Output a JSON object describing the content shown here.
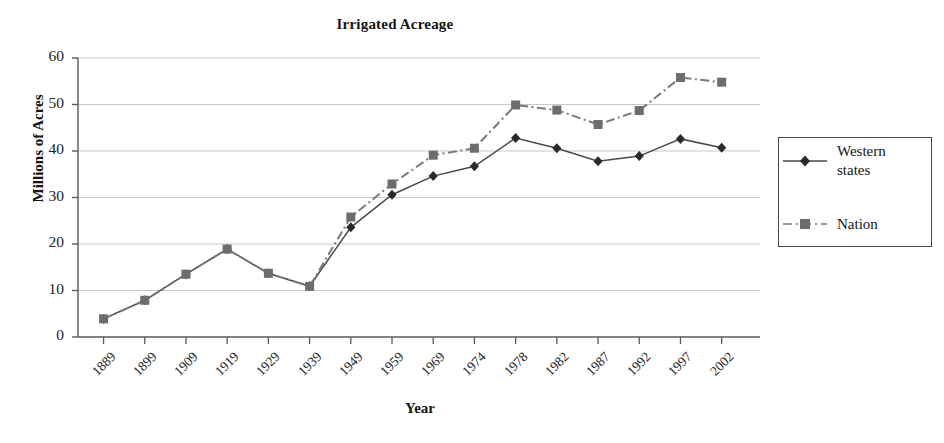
{
  "chart_data": {
    "type": "line",
    "title": "Irrigated Acreage",
    "xlabel": "Year",
    "ylabel": "Millions of Acres",
    "categories": [
      "1889",
      "1899",
      "1909",
      "1919",
      "1929",
      "1939",
      "1949",
      "1959",
      "1969",
      "1974",
      "1978",
      "1982",
      "1987",
      "1992",
      "1997",
      "2002"
    ],
    "ylim": [
      0,
      60
    ],
    "yticks": [
      0,
      10,
      20,
      30,
      40,
      50,
      60
    ],
    "grid": true,
    "legend_position": "right",
    "series": [
      {
        "name": "Western states",
        "marker": "diamond",
        "line_style": "solid",
        "color": "#4a4a4a",
        "values": [
          3.9,
          7.9,
          13.5,
          18.9,
          13.7,
          10.9,
          23.6,
          30.6,
          34.6,
          36.7,
          42.8,
          40.6,
          37.8,
          38.9,
          42.6,
          40.7
        ]
      },
      {
        "name": "Nation",
        "marker": "square",
        "line_style": "dash-dot",
        "color": "#7a7a7a",
        "values": [
          3.9,
          7.9,
          13.5,
          18.9,
          13.7,
          10.9,
          25.8,
          32.9,
          39.1,
          40.6,
          49.9,
          48.8,
          45.7,
          48.7,
          55.8,
          54.8
        ]
      }
    ]
  },
  "legend": {
    "entries": [
      {
        "label_line1": "Western",
        "label_line2": "states"
      },
      {
        "label_line1": "Nation",
        "label_line2": ""
      }
    ]
  }
}
